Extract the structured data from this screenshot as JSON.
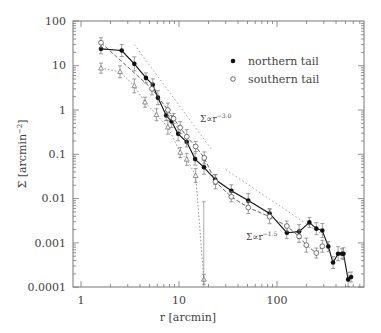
{
  "chart_data": {
    "type": "scatter",
    "title": "",
    "xlabel": "r [arcmin]",
    "ylabel": "Σ [arcmin⁻²]",
    "xscale": "log",
    "yscale": "log",
    "xlim": [
      0.8,
      650
    ],
    "ylim": [
      0.0001,
      100
    ],
    "x_ticks": [
      "1",
      "10",
      "100"
    ],
    "y_ticks": [
      "0.0001",
      "0.001",
      "0.01",
      "0.1",
      "1",
      "10",
      "100"
    ],
    "legend": {
      "position": "upper right",
      "entries": [
        {
          "label": "northern tail",
          "marker": "filled-circle"
        },
        {
          "label": "southern tail",
          "marker": "open-circle"
        }
      ]
    },
    "annotations": [
      {
        "text": "Σ∝r",
        "sup": "-3.0",
        "x": 21,
        "y": 0.55
      },
      {
        "text": "Σ∝r",
        "sup": "-1.5",
        "x": 100,
        "y": 0.0028
      }
    ],
    "series": [
      {
        "name": "northern tail",
        "marker": "filled-circle",
        "line": "solid",
        "x": [
          1.6,
          2.6,
          3.5,
          4.6,
          5.4,
          6.1,
          7.4,
          8.4,
          9.8,
          12.0,
          14.6,
          18.0,
          23.4,
          34.2,
          50.9,
          84.1,
          126,
          168,
          214,
          252,
          290,
          334,
          373,
          420,
          461,
          477,
          532,
          570
        ],
        "y": [
          24,
          22,
          11,
          5.3,
          3.7,
          1.9,
          0.75,
          0.55,
          0.29,
          0.19,
          0.078,
          0.051,
          0.027,
          0.015,
          0.009,
          0.0046,
          0.0017,
          0.0018,
          0.0029,
          0.0021,
          0.0019,
          0.00083,
          0.00036,
          0.00057,
          0.00057,
          0.00057,
          0.00015,
          0.00017
        ]
      },
      {
        "name": "southern tail",
        "marker": "open-circle",
        "line": "dashed",
        "x": [
          1.6,
          5.3,
          7.7,
          8.8,
          10.3,
          12.0,
          14.8,
          18.1,
          23.6,
          34.2,
          50.9,
          84.1,
          126,
          168,
          199,
          252,
          290
        ],
        "y": [
          33,
          3.0,
          1.0,
          0.64,
          0.4,
          0.25,
          0.15,
          0.083,
          0.024,
          0.011,
          0.0063,
          0.0039,
          0.0024,
          0.0014,
          0.00089,
          0.00059,
          0.00084
        ]
      },
      {
        "name": "third profile",
        "marker": "open-triangle",
        "line": "dotted",
        "x": [
          1.6,
          2.5,
          3.5,
          4.5,
          5.9,
          7.7,
          10.3,
          12.0,
          14.8,
          17.9
        ],
        "y": [
          8.8,
          7.3,
          3.5,
          1.5,
          0.78,
          0.41,
          0.11,
          0.077,
          0.033,
          0.00015
        ]
      }
    ],
    "reference_lines": [
      {
        "label": "Σ∝r^-3.0",
        "style": "dotted",
        "x": [
          3.5,
          22
        ],
        "y": [
          30,
          0.12
        ]
      },
      {
        "label": "Σ∝r^-1.5",
        "style": "dotted",
        "x": [
          30,
          310
        ],
        "y": [
          0.045,
          0.0014
        ]
      }
    ]
  },
  "axes": {
    "xlabel": "r [arcmin]",
    "ylabel_main": "Σ [arcmin",
    "ylabel_sup": "−2",
    "ylabel_close": "]"
  },
  "legend": {
    "north": "northern tail",
    "south": "southern tail"
  },
  "annot": {
    "a1_base": "Σ∝r",
    "a1_sup": "−3.0",
    "a2_base": "Σ∝r",
    "a2_sup": "−1.5"
  },
  "ticks": {
    "x": [
      "1",
      "10",
      "100"
    ],
    "y": [
      "100",
      "10",
      "1",
      "0.1",
      "0.01",
      "0.001",
      "0.0001"
    ]
  }
}
